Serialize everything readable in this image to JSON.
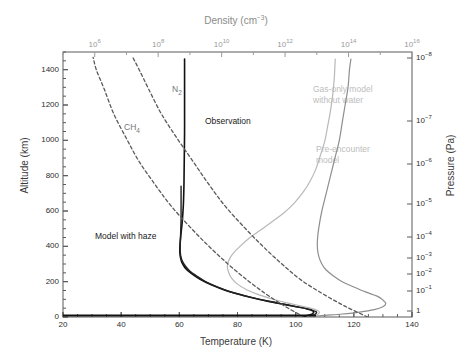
{
  "chart_data": {
    "type": "line",
    "title": "",
    "xlabel": "Temperature (K)",
    "ylabel": "Altitude (km)",
    "x2label": "Density (cm⁻³)",
    "y2label": "Pressure (Pa)",
    "xlim": [
      20,
      140
    ],
    "ylim": [
      0,
      1500
    ],
    "x2lim_log": [
      5,
      16
    ],
    "y2lim_log": [
      0.3,
      -8.4
    ],
    "grid": false,
    "legend": "in-plot annotations",
    "xticks": [
      20,
      40,
      60,
      80,
      100,
      120,
      140
    ],
    "yticks": [
      0,
      200,
      400,
      600,
      800,
      1000,
      1200,
      1400
    ],
    "x2ticks": [
      "10^6",
      "10^8",
      "10^10",
      "10^12",
      "10^14",
      "10^16"
    ],
    "y2ticks": [
      "10^-8",
      "10^-7",
      "10^-6",
      "10^-5",
      "10^-4",
      "10^-3",
      "10^-2",
      "10^-1",
      "1"
    ],
    "series": [
      {
        "name": "Observation",
        "style": "solid",
        "color": "#111111",
        "width": 1.6,
        "axis": "temperature",
        "points": [
          [
            103,
            5
          ],
          [
            105,
            12
          ],
          [
            106,
            22
          ],
          [
            106,
            34
          ],
          [
            104,
            46
          ],
          [
            99,
            62
          ],
          [
            94,
            78
          ],
          [
            88,
            98
          ],
          [
            82,
            122
          ],
          [
            76,
            150
          ],
          [
            71,
            182
          ],
          [
            67,
            215
          ],
          [
            64,
            248
          ],
          [
            62,
            278
          ],
          [
            61,
            305
          ],
          [
            60.5,
            330
          ],
          [
            60.2,
            360
          ],
          [
            60.2,
            400
          ],
          [
            60.5,
            460
          ],
          [
            61,
            540
          ],
          [
            61.4,
            640
          ],
          [
            61.6,
            760
          ],
          [
            61.7,
            900
          ],
          [
            61.8,
            1050
          ],
          [
            61.8,
            1200
          ],
          [
            61.8,
            1350
          ],
          [
            61.8,
            1460
          ]
        ]
      },
      {
        "name": "Model with haze",
        "style": "solid",
        "color": "#222222",
        "width": 1.4,
        "axis": "temperature",
        "points": [
          [
            104,
            4
          ],
          [
            106,
            11
          ],
          [
            107,
            20
          ],
          [
            107,
            30
          ],
          [
            105,
            42
          ],
          [
            101,
            56
          ],
          [
            96,
            72
          ],
          [
            90,
            92
          ],
          [
            84,
            114
          ],
          [
            78,
            140
          ],
          [
            73,
            170
          ],
          [
            69,
            200
          ],
          [
            66,
            232
          ],
          [
            63.5,
            262
          ],
          [
            62,
            290
          ],
          [
            61,
            318
          ],
          [
            60.5,
            345
          ],
          [
            60.3,
            375
          ],
          [
            60.3,
            410
          ],
          [
            60.4,
            450
          ],
          [
            60.5,
            500
          ],
          [
            60.6,
            560
          ],
          [
            60.6,
            620
          ],
          [
            60.6,
            680
          ],
          [
            60.6,
            740
          ]
        ]
      },
      {
        "name": "Pre-encounter model",
        "style": "solid",
        "color": "#8e8e8e",
        "width": 1.2,
        "axis": "temperature",
        "points": [
          [
            106,
            3
          ],
          [
            110,
            9
          ],
          [
            116,
            17
          ],
          [
            122,
            28
          ],
          [
            127,
            42
          ],
          [
            130,
            58
          ],
          [
            131,
            76
          ],
          [
            130,
            96
          ],
          [
            128,
            118
          ],
          [
            124,
            142
          ],
          [
            120,
            170
          ],
          [
            116,
            200
          ],
          [
            113,
            232
          ],
          [
            110.5,
            266
          ],
          [
            109,
            300
          ],
          [
            108,
            340
          ],
          [
            107.5,
            385
          ],
          [
            107.5,
            440
          ],
          [
            108,
            510
          ],
          [
            109,
            600
          ],
          [
            110.5,
            700
          ],
          [
            112,
            800
          ],
          [
            113.5,
            900
          ],
          [
            115,
            1000
          ],
          [
            116,
            1100
          ],
          [
            117,
            1200
          ],
          [
            118,
            1300
          ],
          [
            118.5,
            1400
          ],
          [
            119,
            1460
          ]
        ]
      },
      {
        "name": "Gas-only model without water",
        "style": "solid",
        "color": "#b8b8b8",
        "width": 1.2,
        "axis": "temperature",
        "points": [
          [
            104,
            4
          ],
          [
            107,
            11
          ],
          [
            108,
            20
          ],
          [
            108,
            32
          ],
          [
            106,
            46
          ],
          [
            102,
            62
          ],
          [
            97,
            80
          ],
          [
            92,
            102
          ],
          [
            87,
            128
          ],
          [
            83,
            156
          ],
          [
            80,
            186
          ],
          [
            78,
            218
          ],
          [
            77,
            250
          ],
          [
            76.5,
            284
          ],
          [
            77,
            320
          ],
          [
            78.5,
            360
          ],
          [
            81,
            402
          ],
          [
            84,
            446
          ],
          [
            88,
            492
          ],
          [
            92,
            540
          ],
          [
            96,
            590
          ],
          [
            99.5,
            645
          ],
          [
            102.5,
            705
          ],
          [
            105,
            770
          ],
          [
            107,
            840
          ],
          [
            108.5,
            915
          ],
          [
            110,
            995
          ],
          [
            111,
            1080
          ],
          [
            112,
            1170
          ],
          [
            112.8,
            1265
          ],
          [
            113.3,
            1360
          ],
          [
            113.6,
            1460
          ]
        ]
      },
      {
        "name": "N2",
        "style": "dashed",
        "color": "#5a5a5a",
        "width": 1.3,
        "axis": "density",
        "points": [
          [
            14.6,
            0
          ],
          [
            13.9,
            60
          ],
          [
            13.2,
            130
          ],
          [
            12.5,
            210
          ],
          [
            11.9,
            300
          ],
          [
            11.3,
            400
          ],
          [
            10.7,
            510
          ],
          [
            10.1,
            630
          ],
          [
            9.6,
            750
          ],
          [
            9.1,
            880
          ],
          [
            8.6,
            1010
          ],
          [
            8.1,
            1150
          ],
          [
            7.7,
            1290
          ],
          [
            7.4,
            1400
          ],
          [
            7.2,
            1470
          ]
        ]
      },
      {
        "name": "CH4",
        "style": "dashed",
        "color": "#5a5a5a",
        "width": 1.3,
        "axis": "density",
        "points": [
          [
            12.6,
            0
          ],
          [
            12.0,
            60
          ],
          [
            11.4,
            130
          ],
          [
            10.8,
            210
          ],
          [
            10.2,
            300
          ],
          [
            9.6,
            400
          ],
          [
            9.0,
            510
          ],
          [
            8.4,
            630
          ],
          [
            7.9,
            750
          ],
          [
            7.4,
            880
          ],
          [
            7.0,
            1010
          ],
          [
            6.6,
            1150
          ],
          [
            6.3,
            1290
          ],
          [
            6.05,
            1400
          ],
          [
            5.95,
            1470
          ]
        ]
      }
    ],
    "annotations": [
      {
        "key": "observation",
        "text": "Observation",
        "tone": "dark"
      },
      {
        "key": "n2",
        "text": "N",
        "sub": "2",
        "tone": "mid"
      },
      {
        "key": "ch4",
        "text": "CH",
        "sub": "4",
        "tone": "mid"
      },
      {
        "key": "model_haze",
        "text": "Model with haze",
        "tone": "dark"
      },
      {
        "key": "gas_only_l1",
        "text": "Gas-only model",
        "tone": "light"
      },
      {
        "key": "gas_only_l2",
        "text": "without water",
        "tone": "light"
      },
      {
        "key": "pre_enc_l1",
        "text": "Pre-encounter",
        "tone": "light"
      },
      {
        "key": "pre_enc_l2",
        "text": "model",
        "tone": "light"
      }
    ]
  },
  "axes": {
    "bottom": {
      "title": "Temperature (K)",
      "ticks": [
        "20",
        "40",
        "60",
        "80",
        "100",
        "120",
        "140"
      ]
    },
    "left": {
      "title": "Altitude (km)",
      "ticks": [
        "1400",
        "1200",
        "1000",
        "800",
        "600",
        "400",
        "200",
        "0"
      ]
    },
    "top": {
      "title_main": "Density (cm",
      "title_sup": "−3",
      "title_tail": ")",
      "title_plain": "Density (cm⁻³)",
      "ticks": [
        {
          "mant": "10",
          "exp": "6"
        },
        {
          "mant": "10",
          "exp": "8"
        },
        {
          "mant": "10",
          "exp": "10"
        },
        {
          "mant": "10",
          "exp": "12"
        },
        {
          "mant": "10",
          "exp": "14"
        },
        {
          "mant": "10",
          "exp": "16"
        }
      ]
    },
    "right": {
      "title": "Pressure (Pa)",
      "ticks": [
        {
          "mant": "10",
          "exp": "−8"
        },
        {
          "mant": "10",
          "exp": "−7"
        },
        {
          "mant": "10",
          "exp": "−6"
        },
        {
          "mant": "10",
          "exp": "−5"
        },
        {
          "mant": "10",
          "exp": "−4"
        },
        {
          "mant": "10",
          "exp": "−3"
        },
        {
          "mant": "10",
          "exp": "−2"
        },
        {
          "mant": "10",
          "exp": "−1"
        },
        {
          "mant": "1",
          "exp": ""
        }
      ]
    }
  },
  "colors": {
    "frame": "#5a5a5a",
    "observation": "#111111",
    "model_haze": "#222222",
    "pre_encounter": "#8e8e8e",
    "gas_only": "#b8b8b8",
    "dashed": "#5a5a5a",
    "top_axis_text": "#9a9a9a"
  }
}
